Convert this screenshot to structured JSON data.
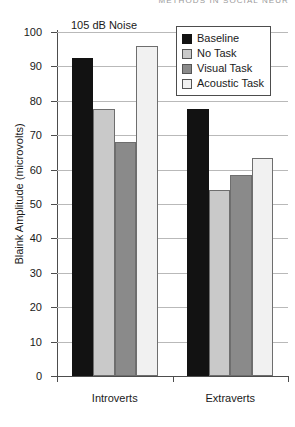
{
  "running_header": "METHODS IN SOCIAL NEUR",
  "annotation": "105 dB Noise",
  "chart_data": {
    "type": "bar",
    "title": "",
    "subtitle": "",
    "annotation": "105 dB Noise",
    "xlabel": "",
    "ylabel": "Blaink Amplitude (microvolts)",
    "ylim": [
      0,
      100
    ],
    "ytick_step": 10,
    "yticks": [
      "100",
      "90",
      "80",
      "70",
      "60",
      "50",
      "40",
      "30",
      "20",
      "10",
      "0"
    ],
    "grid": true,
    "legend_position": "top-right",
    "categories": [
      "Introverts",
      "Extraverts"
    ],
    "series": [
      {
        "name": "Baseline",
        "color": "#121212",
        "values": [
          92.5,
          77.5
        ]
      },
      {
        "name": "No Task",
        "color": "#c9c9c9",
        "values": [
          77.5,
          54.0
        ]
      },
      {
        "name": "Visual Task",
        "color": "#8a8a8a",
        "values": [
          68.0,
          58.5
        ]
      },
      {
        "name": "Acoustic Task",
        "color": "#f1f1f1",
        "values": [
          96.0,
          63.5
        ]
      }
    ]
  },
  "legend": {
    "items": [
      {
        "label": "Baseline",
        "color": "#121212"
      },
      {
        "label": "No Task",
        "color": "#c9c9c9"
      },
      {
        "label": "Visual Task",
        "color": "#8a8a8a"
      },
      {
        "label": "Acoustic Task",
        "color": "#f1f1f1"
      }
    ]
  }
}
